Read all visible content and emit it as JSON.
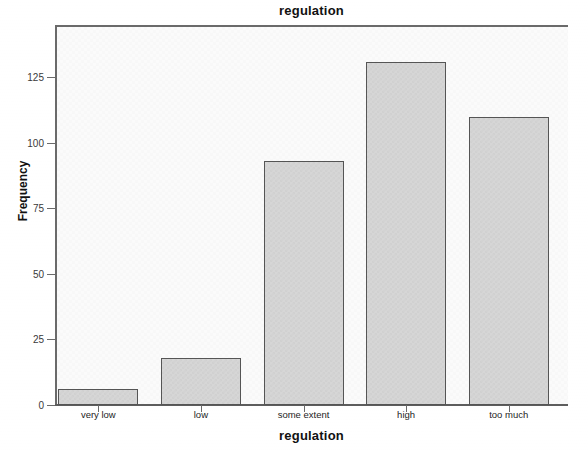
{
  "chart_data": {
    "type": "bar",
    "title": "regulation",
    "xlabel": "regulation",
    "ylabel": "Frequency",
    "categories": [
      "very low",
      "low",
      "some extent",
      "high",
      "too much"
    ],
    "values": [
      6,
      18,
      93,
      131,
      110
    ],
    "ylim": [
      0,
      145
    ],
    "y_ticks": [
      0,
      25,
      50,
      75,
      100,
      125
    ],
    "y_tick_labels": [
      "0",
      "25",
      "50",
      "75",
      "100",
      "125"
    ],
    "grid": false,
    "legend": null,
    "colors": {
      "bar_fill": "#d6d6d6",
      "bar_border": "#555555",
      "plot_background": "#fbfbfb",
      "axis": "#6a6a6a",
      "text": "#111111"
    }
  }
}
